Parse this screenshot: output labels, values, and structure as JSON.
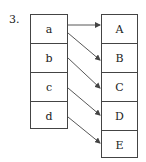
{
  "problem_number": "3.",
  "left_column": {
    "items": [
      "a",
      "b",
      "c",
      "d"
    ]
  },
  "right_column": {
    "items": [
      "A",
      "B",
      "C",
      "D",
      "E"
    ]
  },
  "mappings": [
    {
      "from": "a",
      "to": "A"
    },
    {
      "from": "a",
      "to": "B"
    },
    {
      "from": "b",
      "to": "C"
    },
    {
      "from": "c",
      "to": "D"
    },
    {
      "from": "d",
      "to": "E"
    }
  ],
  "colors": {
    "line": "#444444",
    "background": "#ffffff"
  }
}
